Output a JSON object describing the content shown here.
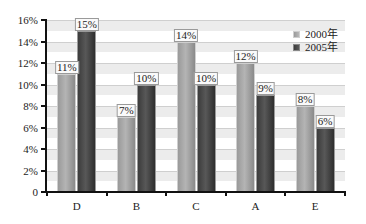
{
  "chart_data": {
    "type": "bar",
    "title": "",
    "xlabel": "",
    "ylabel": "",
    "categories": [
      "D",
      "B",
      "C",
      "A",
      "E"
    ],
    "series": [
      {
        "name": "2000年",
        "values": [
          11,
          7,
          14,
          12,
          8
        ],
        "labels": [
          "11%",
          "7%",
          "14%",
          "12%",
          "8%"
        ],
        "color": "#a6a6a6"
      },
      {
        "name": "2005年",
        "values": [
          15,
          10,
          10,
          9,
          6
        ],
        "labels": [
          "15%",
          "10%",
          "10%",
          "9%",
          "6%"
        ],
        "color": "#484848"
      }
    ],
    "ylim": [
      0,
      16
    ],
    "yticks": [
      0,
      2,
      4,
      6,
      8,
      10,
      12,
      14,
      16
    ],
    "ytick_labels": [
      "0",
      "2%",
      "4%",
      "6%",
      "8%",
      "10%",
      "12%",
      "14%",
      "16%"
    ],
    "grid": true,
    "legend_position": "upper right",
    "value_unit": "%"
  },
  "legend": {
    "items": [
      {
        "label": "2000年",
        "color": "#a6a6a6"
      },
      {
        "label": "2005年",
        "color": "#484848"
      }
    ]
  }
}
